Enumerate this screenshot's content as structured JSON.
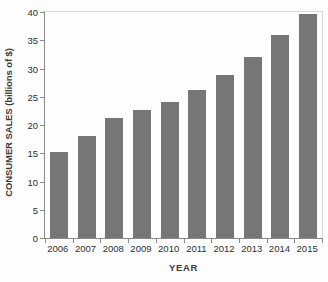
{
  "chart_data": {
    "type": "bar",
    "title": "",
    "xlabel": "YEAR",
    "ylabel": "CONSUMER SALES (billions of $)",
    "categories": [
      "2006",
      "2007",
      "2008",
      "2009",
      "2010",
      "2011",
      "2012",
      "2013",
      "2014",
      "2015"
    ],
    "values": [
      15.3,
      18.0,
      21.3,
      22.7,
      24.0,
      26.2,
      28.8,
      32.0,
      36.0,
      39.6
    ],
    "ylim": [
      0,
      40
    ],
    "ytick_labels": [
      "0",
      "5",
      "10",
      "15",
      "20",
      "25",
      "30",
      "35",
      "40"
    ],
    "ytick_values": [
      0,
      5,
      10,
      15,
      20,
      25,
      30,
      35,
      40
    ],
    "ytick_step": 5,
    "grid": false,
    "legend": false,
    "legend_position": "none",
    "bar_color": "#767676",
    "axis_color": "#8a8a8a",
    "frame_color": "#d8d8d8",
    "background_color": "#fdfdfd",
    "text_color": "#2f2f2f"
  }
}
